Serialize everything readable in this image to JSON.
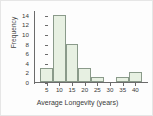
{
  "chart_data": {
    "type": "bar",
    "title": "",
    "subtitle": "",
    "xlabel": "Average Longevity (years)",
    "ylabel": "Frequency",
    "categories": [
      "2.5-7.5",
      "7.5-12.5",
      "12.5-17.5",
      "17.5-22.5",
      "22.5-27.5",
      "27.5-32.5",
      "32.5-37.5",
      "37.5-42.5"
    ],
    "bin_edges": [
      2.5,
      7.5,
      12.5,
      17.5,
      22.5,
      27.5,
      32.5,
      37.5,
      42.5
    ],
    "values": [
      3,
      14,
      8,
      3,
      1,
      0,
      1,
      2
    ],
    "xlim": [
      0,
      45
    ],
    "ylim": [
      0,
      15
    ],
    "xticks": [
      5,
      10,
      15,
      20,
      25,
      30,
      35,
      40
    ],
    "xtick_labels": [
      "5",
      "10",
      "15",
      "20",
      "25",
      "30",
      "35",
      "40"
    ],
    "yticks": [
      0,
      2,
      4,
      6,
      8,
      10,
      12,
      14
    ],
    "ytick_labels": [
      "0",
      "2",
      "4",
      "6",
      "8",
      "10",
      "12",
      "14"
    ],
    "grid": false,
    "legend": null,
    "legend_position": "none",
    "annotations": [],
    "colors": {
      "bar_fill": "#e7f0e2",
      "bar_border": "#8a9a8a",
      "axis": "#6b6b6b",
      "text": "#3a3a3a",
      "background": "#fdfdfd",
      "frame_border": "#e6e6e6"
    }
  }
}
